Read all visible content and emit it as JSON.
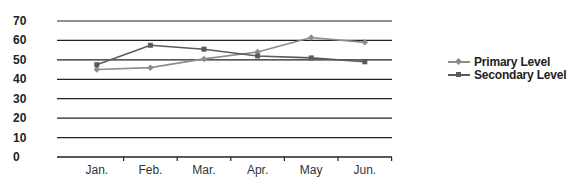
{
  "chart_data": {
    "type": "line",
    "title": "",
    "xlabel": "",
    "ylabel": "",
    "categories": [
      "Jan.",
      "Feb.",
      "Mar.",
      "Apr.",
      "May",
      "Jun."
    ],
    "series": [
      {
        "name": "Primary Level",
        "values": [
          45,
          46,
          50.5,
          54,
          61.5,
          59
        ],
        "color": "#8c8c8c",
        "marker": "diamond"
      },
      {
        "name": "Secondary Level",
        "values": [
          47.5,
          57.5,
          55.5,
          52,
          51,
          49
        ],
        "color": "#5a5a5a",
        "marker": "square"
      }
    ],
    "ylim": [
      0,
      70
    ],
    "yticks": [
      0,
      10,
      20,
      30,
      40,
      50,
      60,
      70
    ],
    "grid": true,
    "legend_position": "right",
    "gridline_color": "#222222"
  },
  "legend": {
    "items": [
      {
        "label": "Primary Level",
        "color": "#8c8c8c"
      },
      {
        "label": "Secondary Level",
        "color": "#5a5a5a"
      }
    ]
  }
}
